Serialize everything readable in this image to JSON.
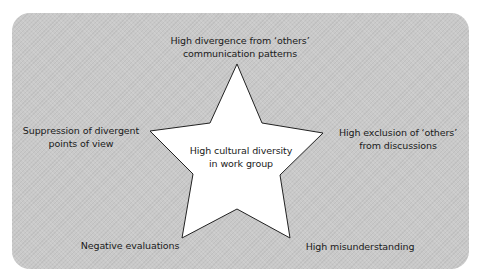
{
  "diagram": {
    "center": {
      "line1": "High cultural diversity",
      "line2": "in work group"
    },
    "outcomes": [
      {
        "id": "top",
        "line1": "High divergence from ‘others’",
        "line2": "communication patterns"
      },
      {
        "id": "right",
        "line1": "High exclusion of ‘others’",
        "line2": "from discussions"
      },
      {
        "id": "bottom-right",
        "line1": "High misunderstanding"
      },
      {
        "id": "bottom-left",
        "line1": "Negative evaluations"
      },
      {
        "id": "left",
        "line1": "Suppression of divergent",
        "line2": "points of view"
      }
    ],
    "colors": {
      "panel": "#c9c9c9",
      "star_fill": "#ffffff",
      "star_stroke": "#222222",
      "text": "#1a1a1a"
    }
  }
}
